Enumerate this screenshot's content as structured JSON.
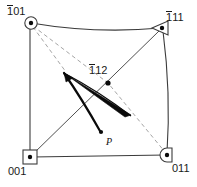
{
  "figure": {
    "type": "crystallographic-pole-diagram",
    "width": 197,
    "height": 187,
    "background_color": "#ffffff",
    "line_color": "#3b3b3b",
    "dashed_color": "#8a8a8a",
    "accent_color": "#000000",
    "text_color": "#1a1a1a"
  },
  "labels": {
    "top_left": {
      "bar": "1",
      "rest": "01",
      "full": "1̄01"
    },
    "top_right": {
      "bar": "1",
      "rest": "11",
      "full": "1̄11"
    },
    "center": {
      "bar": "1",
      "rest": "12",
      "full": "1̄12"
    },
    "bottom_left": {
      "text": "001"
    },
    "bottom_right": {
      "text": "011"
    },
    "vector_point": {
      "text": "P"
    }
  },
  "nodes": [
    {
      "id": "node-101",
      "label": "1̄01",
      "marker": "circle-dot",
      "x": 31,
      "y": 23
    },
    {
      "id": "node-111",
      "label": "1̄11",
      "marker": "triangle-dot",
      "x": 161,
      "y": 28
    },
    {
      "id": "node-112",
      "label": "1̄12",
      "marker": "dot",
      "x": 108,
      "y": 83
    },
    {
      "id": "node-001",
      "label": "001",
      "marker": "square-dot",
      "x": 30,
      "y": 157
    },
    {
      "id": "node-011",
      "label": "011",
      "marker": "dshape-dot",
      "x": 167,
      "y": 155
    },
    {
      "id": "node-p",
      "label": "P",
      "marker": "dot",
      "x": 101,
      "y": 132
    }
  ],
  "edges": [
    {
      "id": "edge-top",
      "from": "node-101",
      "to": "node-111",
      "style": "solid-curved"
    },
    {
      "id": "edge-left",
      "from": "node-101",
      "to": "node-001",
      "style": "solid"
    },
    {
      "id": "edge-right",
      "from": "node-111",
      "to": "node-011",
      "style": "solid-curved"
    },
    {
      "id": "edge-bottom",
      "from": "node-001",
      "to": "node-011",
      "style": "solid"
    },
    {
      "id": "edge-diagonal-001-111",
      "from": "node-001",
      "to": "node-111",
      "style": "solid"
    },
    {
      "id": "edge-dashed-101-011",
      "from": "node-101",
      "to": "node-011",
      "style": "dashed"
    },
    {
      "id": "edge-dashed-101-wedge",
      "from": "node-101",
      "to": "wedge-origin",
      "style": "dashed"
    }
  ],
  "vectors": [
    {
      "id": "wedge-arrow",
      "from_x": 64,
      "from_y": 73,
      "to_x": 130,
      "to_y": 114,
      "style": "thick-wedge"
    },
    {
      "id": "p-arrow",
      "from_x": 64,
      "from_y": 73,
      "to_x": 101,
      "to_y": 132,
      "style": "thick-curved"
    }
  ]
}
